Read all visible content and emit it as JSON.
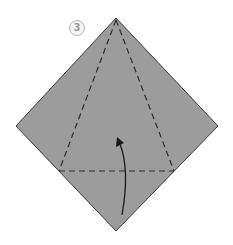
{
  "diagram": {
    "step_number": "3",
    "paper_color": "#9c9c9c",
    "edge_color": "#3a3a3a",
    "crease_color": "#2e2e2e",
    "arrow_color": "#1a1a1a",
    "shape": "square-diamond",
    "vertices": {
      "top": [
        116,
        18
      ],
      "right": [
        218,
        126
      ],
      "bottom": [
        116,
        231
      ],
      "left": [
        16,
        126
      ]
    },
    "crease_lines": [
      {
        "type": "valley-fold-dashed",
        "from": [
          116,
          20
        ],
        "to": [
          59,
          171
        ]
      },
      {
        "type": "valley-fold-dashed",
        "from": [
          116,
          20
        ],
        "to": [
          174,
          171
        ]
      },
      {
        "type": "valley-fold-dashed",
        "from": [
          59,
          171
        ],
        "to": [
          174,
          171
        ]
      }
    ],
    "fold_arrow": {
      "direction": "up",
      "from": [
        122,
        215
      ],
      "to": [
        117,
        138
      ]
    }
  }
}
